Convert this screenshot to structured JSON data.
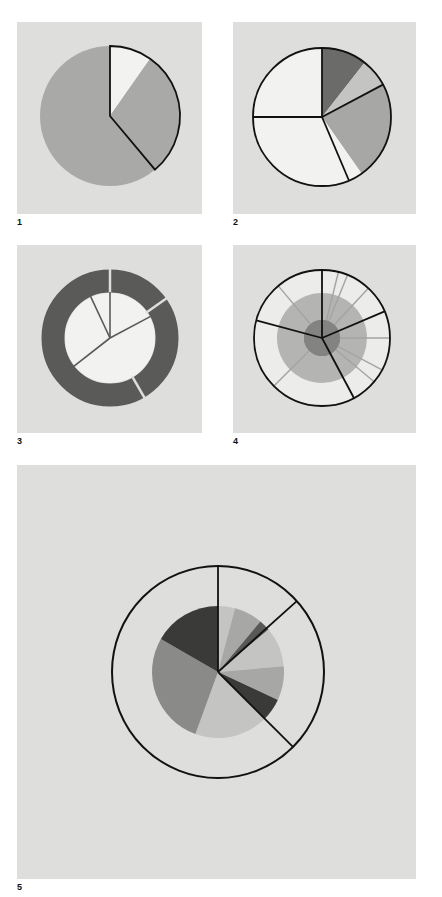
{
  "colors": {
    "background": "#ffffff",
    "panel": "#dededd",
    "white_segment": "#f2f2f1",
    "light_gray": "#c4c4c3",
    "mid_gray": "#a7a7a6",
    "gray": "#a9a9a8",
    "dark_gray": "#6b6b6a",
    "darker_gray": "#585857",
    "darkest": "#3a3a39",
    "outline": "#111111"
  },
  "figures": [
    {
      "id": 1,
      "label": "1",
      "type": "pie-exploded-outline"
    },
    {
      "id": 2,
      "label": "2",
      "type": "pie-grouped-outline"
    },
    {
      "id": 3,
      "label": "3",
      "type": "donut-with-inner-spokes"
    },
    {
      "id": 4,
      "label": "4",
      "type": "concentric-rings-with-radial-dividers"
    },
    {
      "id": 5,
      "label": "5",
      "type": "pie-inside-outlined-ring"
    }
  ],
  "chart_data": [
    {
      "type": "pie",
      "title": "1",
      "slices_deg_from_top_clockwise": [
        {
          "start": 0,
          "end": 35,
          "shade": "white"
        },
        {
          "start": 35,
          "end": 140,
          "shade": "mid-gray"
        },
        {
          "start": 140,
          "end": 360,
          "shade": "mid-gray"
        }
      ],
      "outlined_group": [
        0,
        140
      ]
    },
    {
      "type": "pie",
      "title": "2",
      "slices_deg_from_top_clockwise": [
        {
          "start": 0,
          "end": 38,
          "shade": "dark-gray"
        },
        {
          "start": 38,
          "end": 62,
          "shade": "light-gray"
        },
        {
          "start": 62,
          "end": 145,
          "shade": "mid-gray"
        },
        {
          "start": 145,
          "end": 157,
          "shade": "white"
        },
        {
          "start": 157,
          "end": 270,
          "shade": "white"
        },
        {
          "start": 270,
          "end": 360,
          "shade": "white"
        }
      ],
      "outline_boundaries_deg": [
        0,
        62,
        157,
        270
      ]
    },
    {
      "type": "donut",
      "title": "3",
      "ring_gaps_deg": [
        0,
        55,
        150
      ],
      "inner_spokes_deg": [
        0,
        335,
        62,
        232
      ]
    },
    {
      "type": "pie",
      "title": "4",
      "outer_boundaries_deg": [
        0,
        67,
        152,
        285
      ],
      "inner_light_dividers_deg": [
        14,
        22,
        43,
        90,
        118,
        130,
        225,
        320
      ]
    },
    {
      "type": "pie",
      "title": "5",
      "inner_slices_deg_from_top_clockwise": [
        {
          "start": 0,
          "end": 15,
          "shade": "light-gray"
        },
        {
          "start": 15,
          "end": 40,
          "shade": "mid-gray"
        },
        {
          "start": 40,
          "end": 50,
          "shade": "darker-gray"
        },
        {
          "start": 50,
          "end": 85,
          "shade": "light-gray"
        },
        {
          "start": 85,
          "end": 115,
          "shade": "mid-gray"
        },
        {
          "start": 115,
          "end": 135,
          "shade": "darkest"
        },
        {
          "start": 135,
          "end": 200,
          "shade": "light-gray"
        },
        {
          "start": 200,
          "end": 300,
          "shade": "gray"
        },
        {
          "start": 300,
          "end": 360,
          "shade": "darkest"
        }
      ],
      "outer_ring_boundaries_deg": [
        0,
        48,
        135
      ]
    }
  ]
}
